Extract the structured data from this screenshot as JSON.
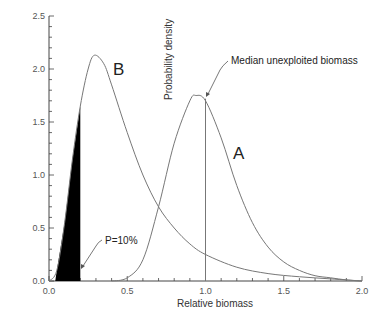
{
  "chart_data": {
    "type": "line",
    "title": "",
    "xlabel": "Relative biomass",
    "ylabel": "Probability density",
    "xlim": [
      0.0,
      2.0
    ],
    "ylim": [
      0.0,
      2.5
    ],
    "x_ticks": [
      "0.0",
      "0.5",
      "1.0",
      "1.5",
      "2.0"
    ],
    "y_ticks": [
      "0.0",
      "0.5",
      "1.0",
      "1.5",
      "2.0",
      "2.5"
    ],
    "grid": false,
    "legend": "none",
    "series": [
      {
        "name": "A",
        "x": [
          0.4,
          0.5,
          0.6,
          0.7,
          0.8,
          0.9,
          0.94,
          1.0,
          1.1,
          1.2,
          1.3,
          1.4,
          1.5,
          1.6,
          1.7,
          1.8,
          1.9,
          2.0
        ],
        "y": [
          0.0,
          0.03,
          0.2,
          0.7,
          1.3,
          1.7,
          1.75,
          1.7,
          1.35,
          0.9,
          0.55,
          0.32,
          0.18,
          0.1,
          0.05,
          0.03,
          0.01,
          0.0
        ]
      },
      {
        "name": "B",
        "x": [
          0.0,
          0.05,
          0.1,
          0.15,
          0.2,
          0.25,
          0.29,
          0.35,
          0.4,
          0.5,
          0.6,
          0.7,
          0.8,
          0.9,
          1.0,
          1.2,
          1.4,
          1.6,
          1.8,
          2.0
        ],
        "y": [
          0.0,
          0.1,
          0.55,
          1.15,
          1.65,
          2.0,
          2.13,
          2.05,
          1.85,
          1.4,
          1.0,
          0.7,
          0.5,
          0.35,
          0.25,
          0.13,
          0.07,
          0.04,
          0.02,
          0.0
        ]
      }
    ],
    "shaded_region": {
      "series": "B",
      "x_from": 0.0,
      "x_to": 0.2,
      "color": "#000000"
    },
    "vertical_line": {
      "x": 1.0,
      "y_top": 1.72
    },
    "annotations": [
      {
        "text": "Median unexploited biomass",
        "x": 1.0,
        "y": 1.72
      },
      {
        "text": "P=10%",
        "x": 0.2,
        "y": 0.35
      },
      {
        "text": "A",
        "x": 1.22,
        "y": 1.1
      },
      {
        "text": "B",
        "x": 0.45,
        "y": 2.0
      }
    ]
  },
  "labels": {
    "xlabel": "Relative biomass",
    "ylabel": "Probability density",
    "median": "Median unexploited biomass",
    "p10": "P=10%",
    "curveA": "A",
    "curveB": "B"
  },
  "colors": {
    "curve": "#777777",
    "axis": "#444444",
    "fill": "#000000"
  }
}
